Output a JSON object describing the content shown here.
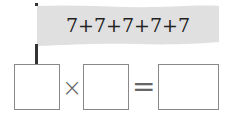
{
  "banner": {
    "expression": "7+7+7+7+7",
    "color": "#e0e0e0"
  },
  "equation": {
    "operator_times": "×",
    "operator_equals": "=",
    "boxes": [
      {
        "value": ""
      },
      {
        "value": ""
      },
      {
        "value": ""
      }
    ]
  }
}
